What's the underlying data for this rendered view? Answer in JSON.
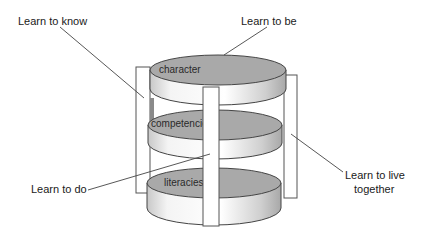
{
  "diagram": {
    "layers": [
      {
        "label": "character"
      },
      {
        "label": "competencies"
      },
      {
        "label": "literacies"
      }
    ],
    "pillars": [
      {
        "label": "Learn to know"
      },
      {
        "label": "Learn to be"
      },
      {
        "label": "Learn to do"
      },
      {
        "label": "Learn to live",
        "label_line2": "together"
      }
    ],
    "colors": {
      "disk_top": "#a9a9a9",
      "disk_side_light": "#ffffff",
      "disk_side_dark": "#bdbdbd",
      "pillar": "#ffffff",
      "stroke": "#555555"
    }
  }
}
